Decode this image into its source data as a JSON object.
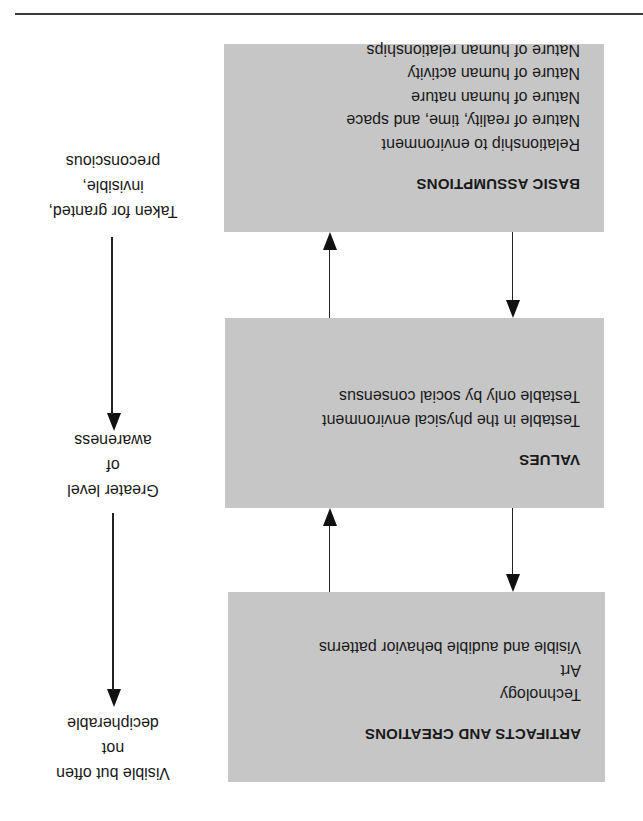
{
  "diagram": {
    "orientation_degrees": 180,
    "colors": {
      "box_fill": "#c6c6c6",
      "line": "#222222",
      "text": "#1a1a1a"
    },
    "levels": [
      {
        "title": "ARTIFACTS AND CREATIONS",
        "items": [
          "Technology",
          "Art",
          "Visible and audible behavior patterns"
        ]
      },
      {
        "title": "VALUES",
        "items": [
          "Testable in the physical environment",
          "Testable only by social consensus"
        ]
      },
      {
        "title": "BASIC ASSUMPTIONS",
        "items": [
          "Relationship to environment",
          "Nature of reality, time, and space",
          "Nature of human nature",
          "Nature of human activity",
          "Nature of human relationships"
        ]
      }
    ],
    "awareness_scale": [
      {
        "lines": [
          "Visible but often",
          "not",
          "decipherable"
        ]
      },
      {
        "lines": [
          "Greater level",
          "of",
          "awareness"
        ]
      },
      {
        "lines": [
          "Taken for granted,",
          "invisible,",
          "preconscious"
        ]
      }
    ],
    "connectors": [
      {
        "between": [
          "ARTIFACTS AND CREATIONS",
          "VALUES"
        ],
        "arrows": [
          "down",
          "up"
        ]
      },
      {
        "between": [
          "VALUES",
          "BASIC ASSUMPTIONS"
        ],
        "arrows": [
          "down",
          "up"
        ]
      }
    ]
  }
}
